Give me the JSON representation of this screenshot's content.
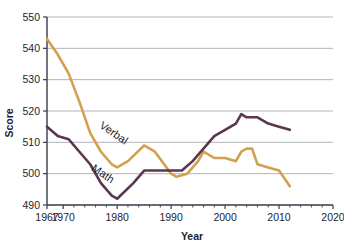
{
  "chart_data": {
    "type": "line",
    "title": "",
    "xlabel": "Year",
    "ylabel": "Score",
    "xlim": [
      1967,
      2020
    ],
    "ylim": [
      490,
      550
    ],
    "grid": true,
    "legend_position": "inline-labels",
    "xticks": [
      1967,
      1970,
      1980,
      1990,
      2000,
      2010,
      2020
    ],
    "xtick_labels": [
      "1967",
      "1970",
      "1980",
      "1990",
      "2000",
      "2010",
      "2020"
    ],
    "xticks_minor": [
      1972,
      1974,
      1976,
      1978,
      1982,
      1984,
      1986,
      1988,
      1992,
      1994,
      1996,
      1998,
      2002,
      2004,
      2006,
      2008,
      2012,
      2014,
      2016,
      2018
    ],
    "yticks": [
      490,
      500,
      510,
      520,
      530,
      540,
      550
    ],
    "ytick_labels": [
      "490",
      "500",
      "510",
      "520",
      "530",
      "540",
      "550"
    ],
    "series": [
      {
        "name": "Verbal",
        "color": "#d4a04e",
        "label_x": 1979,
        "label_y": 512,
        "x": [
          1967,
          1969,
          1971,
          1973,
          1975,
          1977,
          1979,
          1980,
          1982,
          1985,
          1987,
          1990,
          1991,
          1993,
          1995,
          1996,
          1998,
          2000,
          2002,
          2003,
          2004,
          2005,
          2006,
          2008,
          2010,
          2012
        ],
        "values": [
          543,
          538,
          532,
          523,
          513,
          507,
          503,
          502,
          504,
          509,
          507,
          500,
          499,
          500,
          504,
          507,
          505,
          505,
          504,
          507,
          508,
          508,
          503,
          502,
          501,
          496
        ]
      },
      {
        "name": "Math",
        "color": "#5a3750",
        "label_x": 1977,
        "label_y": 499,
        "x": [
          1967,
          1969,
          1971,
          1973,
          1975,
          1977,
          1979,
          1980,
          1983,
          1985,
          1987,
          1990,
          1992,
          1994,
          1996,
          1998,
          2000,
          2002,
          2003,
          2004,
          2005,
          2006,
          2008,
          2010,
          2012
        ],
        "values": [
          515,
          512,
          511,
          507,
          503,
          497,
          493,
          492,
          497,
          501,
          501,
          501,
          501,
          504,
          508,
          512,
          514,
          516,
          519,
          518,
          518,
          518,
          516,
          515,
          514
        ]
      }
    ]
  },
  "axes": {
    "y_axis_title": "Score",
    "x_axis_title": "Year"
  },
  "labels": {
    "verbal": "Verbal",
    "math": "Math"
  },
  "colors": {
    "verbal_line": "#d4a04e",
    "math_line": "#5a3750",
    "gridline": "#a9a9b4",
    "axis": "#3a3a4a",
    "text": "#1d1d33",
    "background": "#ffffff"
  }
}
